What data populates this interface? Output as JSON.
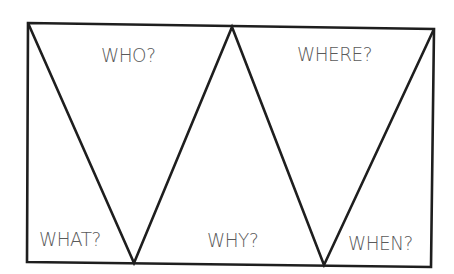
{
  "diagram": {
    "type": "5W question organizer (zigzag triangles in rectangle)",
    "line_color": "#1e1e1e",
    "text_color": "#5a5a5a",
    "labels": {
      "who": "WHO?",
      "where": "WHERE?",
      "what": "WHAT?",
      "why": "WHY?",
      "when": "WHEN?"
    }
  }
}
